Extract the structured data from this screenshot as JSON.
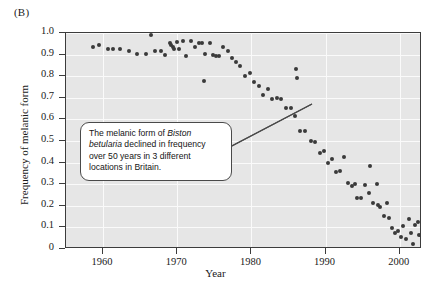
{
  "panel": {
    "label": "(B)"
  },
  "axes": {
    "x_title": "Year",
    "y_title": "Frequency of melanic form",
    "x_ticks": [
      "1960",
      "1970",
      "1980",
      "1990",
      "2000"
    ],
    "y_ticks": [
      "1.0",
      "0.9",
      "0.8",
      "0.7",
      "0.6",
      "0.5",
      "0.4",
      "0.3",
      "0.2",
      "0.1",
      "0"
    ]
  },
  "callout": {
    "line1_a": "The melanic form of ",
    "line1_b": "Biston",
    "line2_a": "betularia",
    "line2_b": " declined in frequency",
    "line3": "over 50 years in 3 different",
    "line4": "locations in Britain."
  },
  "colors": {
    "plot_background": "#e6e6e6",
    "gridline": "#fafafa",
    "point": "#3a3a3a",
    "axis": "#3c3c3c",
    "text": "#1a1a1a"
  },
  "chart_data": {
    "type": "scatter",
    "title": "",
    "xlabel": "Year",
    "ylabel": "Frequency of melanic form",
    "xlim": [
      1955,
      2003
    ],
    "ylim": [
      0,
      1.0
    ],
    "grid": true,
    "legend": null,
    "xticks": [
      1960,
      1970,
      1980,
      1990,
      2000
    ],
    "yticks": [
      0,
      0.1,
      0.2,
      0.3,
      0.4,
      0.5,
      0.6,
      0.7,
      0.8,
      0.9,
      1.0
    ],
    "points": [
      [
        1958.6,
        0.935
      ],
      [
        1959.4,
        0.945
      ],
      [
        1960.6,
        0.925
      ],
      [
        1961.4,
        0.925
      ],
      [
        1962.3,
        0.925
      ],
      [
        1963.5,
        0.915
      ],
      [
        1964.6,
        0.905
      ],
      [
        1965.8,
        0.905
      ],
      [
        1966.5,
        0.99
      ],
      [
        1967.0,
        0.915
      ],
      [
        1967.8,
        0.915
      ],
      [
        1968.4,
        0.9
      ],
      [
        1969.0,
        0.955
      ],
      [
        1969.2,
        0.945
      ],
      [
        1969.4,
        0.935
      ],
      [
        1969.6,
        0.925
      ],
      [
        1970.0,
        0.96
      ],
      [
        1970.3,
        0.925
      ],
      [
        1970.8,
        0.965
      ],
      [
        1971.2,
        0.895
      ],
      [
        1971.8,
        0.965
      ],
      [
        1972.4,
        0.935
      ],
      [
        1972.9,
        0.955
      ],
      [
        1973.4,
        0.955
      ],
      [
        1973.8,
        0.905
      ],
      [
        1974.4,
        0.955
      ],
      [
        1974.8,
        0.9
      ],
      [
        1975.2,
        0.895
      ],
      [
        1975.6,
        0.895
      ],
      [
        1973.6,
        0.78
      ],
      [
        1976.2,
        0.935
      ],
      [
        1976.8,
        0.915
      ],
      [
        1977.4,
        0.885
      ],
      [
        1977.9,
        0.865
      ],
      [
        1978.5,
        0.845
      ],
      [
        1979.1,
        0.8
      ],
      [
        1979.8,
        0.815
      ],
      [
        1980.4,
        0.775
      ],
      [
        1981.0,
        0.755
      ],
      [
        1981.6,
        0.715
      ],
      [
        1982.2,
        0.74
      ],
      [
        1982.8,
        0.695
      ],
      [
        1983.4,
        0.7
      ],
      [
        1984.0,
        0.695
      ],
      [
        1984.7,
        0.655
      ],
      [
        1985.3,
        0.655
      ],
      [
        1985.9,
        0.615
      ],
      [
        1986.0,
        0.835
      ],
      [
        1986.1,
        0.79
      ],
      [
        1986.6,
        0.545
      ],
      [
        1987.2,
        0.545
      ],
      [
        1988.0,
        0.5
      ],
      [
        1988.6,
        0.495
      ],
      [
        1989.2,
        0.445
      ],
      [
        1989.8,
        0.455
      ],
      [
        1990.3,
        0.4
      ],
      [
        1990.8,
        0.415
      ],
      [
        1991.4,
        0.355
      ],
      [
        1991.9,
        0.36
      ],
      [
        1992.5,
        0.425
      ],
      [
        1993.0,
        0.305
      ],
      [
        1993.5,
        0.29
      ],
      [
        1994.0,
        0.3
      ],
      [
        1994.2,
        0.235
      ],
      [
        1994.8,
        0.235
      ],
      [
        1995.3,
        0.295
      ],
      [
        1995.8,
        0.26
      ],
      [
        1996.0,
        0.385
      ],
      [
        1996.4,
        0.215
      ],
      [
        1996.9,
        0.3
      ],
      [
        1997.1,
        0.205
      ],
      [
        1997.4,
        0.195
      ],
      [
        1997.9,
        0.155
      ],
      [
        1998.3,
        0.215
      ],
      [
        1998.6,
        0.145
      ],
      [
        1999.0,
        0.095
      ],
      [
        1999.4,
        0.075
      ],
      [
        1999.8,
        0.085
      ],
      [
        2000.2,
        0.055
      ],
      [
        2000.5,
        0.105
      ],
      [
        2000.9,
        0.045
      ],
      [
        2001.2,
        0.14
      ],
      [
        2001.5,
        0.075
      ],
      [
        2001.8,
        0.025
      ],
      [
        2002.1,
        0.11
      ],
      [
        2002.4,
        0.125
      ],
      [
        2002.6,
        0.065
      ]
    ]
  }
}
